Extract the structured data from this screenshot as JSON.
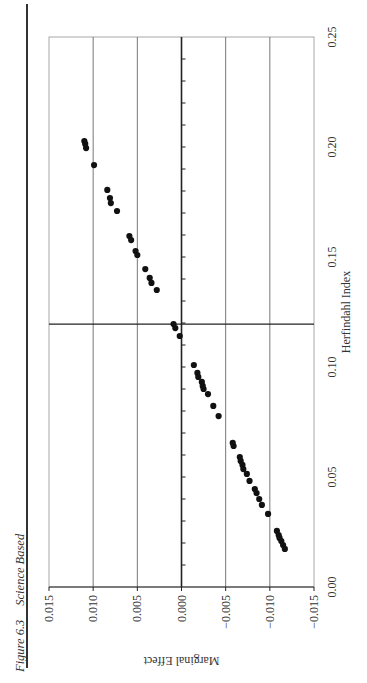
{
  "caption": {
    "figure_label": "Figure 6.3",
    "title": "Science Based"
  },
  "colors": {
    "frame": "#a8a8a8",
    "grid": "#777777",
    "axis": "#222222",
    "points": "#111111"
  },
  "chart_data": {
    "type": "scatter",
    "title": "Science Based",
    "figure_label": "Figure 6.3",
    "orientation_note": "Page rotated 90 degrees counter-clockwise",
    "xlabel": "Herfindahl Index",
    "ylabel": "Marginal Effect",
    "xlim": [
      0.0,
      0.25
    ],
    "ylim": [
      -0.015,
      0.015
    ],
    "x_ticks": [
      "0.00",
      "0.05",
      "0.10",
      "0.15",
      "0.20",
      "0.25"
    ],
    "y_ticks": [
      "0.015",
      "0.010",
      "0.005",
      "0.000",
      "−0.005",
      "−0.010",
      "−0.015"
    ],
    "grid": {
      "y_major": true,
      "x_major": false
    },
    "zero_line": {
      "marginal_effect": 0.0,
      "herfindahl_cross": 0.1195
    },
    "legend": null,
    "series": [
      {
        "name": "Science Based",
        "x": [
          0.2027,
          0.2014,
          0.1995,
          0.1918,
          0.1805,
          0.1768,
          0.1745,
          0.1709,
          0.1595,
          0.1577,
          0.1527,
          0.1509,
          0.1445,
          0.1405,
          0.1382,
          0.135,
          0.1195,
          0.1177,
          0.1141,
          0.1009,
          0.0973,
          0.0955,
          0.0932,
          0.0914,
          0.09,
          0.0877,
          0.0823,
          0.0777,
          0.0655,
          0.0641,
          0.0591,
          0.0573,
          0.0555,
          0.0536,
          0.0514,
          0.0482,
          0.0445,
          0.0427,
          0.04,
          0.0373,
          0.0332,
          0.0255,
          0.0236,
          0.0223,
          0.0209,
          0.0191,
          0.0173
        ],
        "y": [
          0.011,
          0.0109,
          0.0108,
          0.0099,
          0.0084,
          0.0081,
          0.008,
          0.0073,
          0.0059,
          0.0057,
          0.0052,
          0.005,
          0.0041,
          0.0036,
          0.0034,
          0.0028,
          0.0009,
          0.0007,
          0.0002,
          -0.0014,
          -0.0018,
          -0.0019,
          -0.0023,
          -0.0024,
          -0.0025,
          -0.003,
          -0.0036,
          -0.0042,
          -0.0058,
          -0.0059,
          -0.0066,
          -0.0067,
          -0.0069,
          -0.007,
          -0.0074,
          -0.0077,
          -0.0083,
          -0.0085,
          -0.0088,
          -0.0091,
          -0.0098,
          -0.0108,
          -0.011,
          -0.0111,
          -0.0113,
          -0.0115,
          -0.0117
        ]
      }
    ]
  }
}
